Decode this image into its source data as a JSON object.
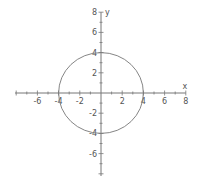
{
  "chart_data": {
    "type": "line",
    "title": "",
    "xlabel": "x",
    "ylabel": "y",
    "xlim": [
      -8,
      8
    ],
    "ylim": [
      -8,
      8
    ],
    "grid": false,
    "x_tick_labels": [
      "-6",
      "-4",
      "-2",
      "2",
      "4",
      "6",
      "8"
    ],
    "y_tick_labels": [
      "8",
      "6",
      "4",
      "2",
      "-2",
      "-4",
      "-6"
    ],
    "series": [
      {
        "name": "circle x^2 + y^2 = 16",
        "shape": "circle",
        "center": [
          0,
          0
        ],
        "radius": 4,
        "points": [
          [
            4,
            0
          ],
          [
            0,
            4
          ],
          [
            -4,
            0
          ],
          [
            0,
            -4
          ]
        ]
      }
    ]
  },
  "colors": {
    "axis": "#777777",
    "curve": "#777777",
    "label": "#555555",
    "background": "#ffffff"
  }
}
